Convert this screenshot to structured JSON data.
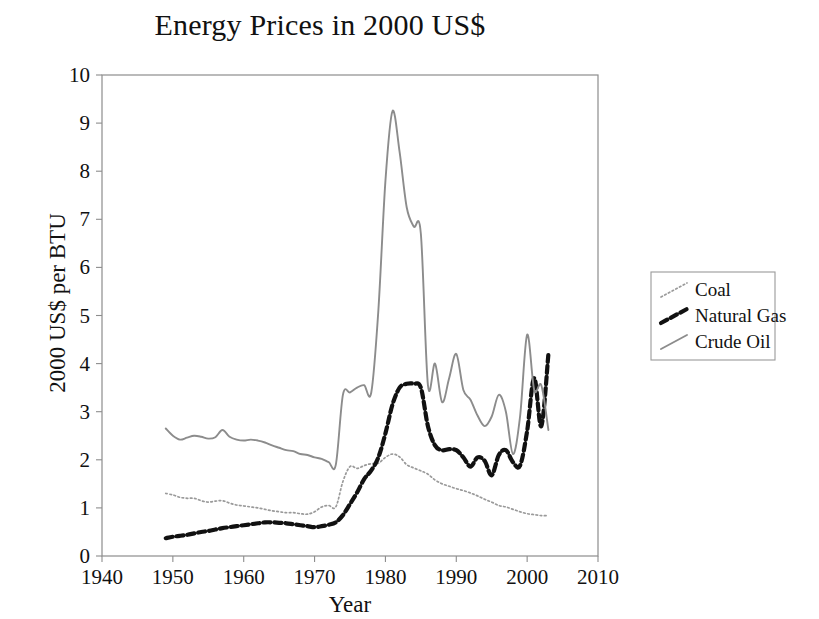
{
  "chart_data": {
    "type": "line",
    "title": "Energy Prices in 2000 US$",
    "xlabel": "Year",
    "ylabel": "2000 US$ per BTU",
    "xlim": [
      1940,
      2010
    ],
    "ylim": [
      0,
      10
    ],
    "xticks": [
      1940,
      1950,
      1960,
      1970,
      1980,
      1990,
      2000,
      2010
    ],
    "yticks": [
      0,
      1,
      2,
      3,
      4,
      5,
      6,
      7,
      8,
      9,
      10
    ],
    "grid": false,
    "legend_position": "right-outside",
    "x": [
      1949,
      1950,
      1951,
      1952,
      1953,
      1954,
      1955,
      1956,
      1957,
      1958,
      1959,
      1960,
      1961,
      1962,
      1963,
      1964,
      1965,
      1966,
      1967,
      1968,
      1969,
      1970,
      1971,
      1972,
      1973,
      1974,
      1975,
      1976,
      1977,
      1978,
      1979,
      1980,
      1981,
      1982,
      1983,
      1984,
      1985,
      1986,
      1987,
      1988,
      1989,
      1990,
      1991,
      1992,
      1993,
      1994,
      1995,
      1996,
      1997,
      1998,
      1999,
      2000,
      2001,
      2002,
      2003
    ],
    "series": [
      {
        "name": "Coal",
        "style": "dotted",
        "color": "#9a9a9a",
        "values": [
          1.3,
          1.27,
          1.22,
          1.2,
          1.2,
          1.15,
          1.12,
          1.14,
          1.15,
          1.1,
          1.06,
          1.04,
          1.02,
          1.0,
          0.97,
          0.94,
          0.92,
          0.9,
          0.9,
          0.88,
          0.87,
          0.92,
          1.02,
          1.05,
          1.02,
          1.55,
          1.86,
          1.82,
          1.88,
          1.92,
          1.93,
          2.05,
          2.12,
          2.06,
          1.9,
          1.83,
          1.77,
          1.7,
          1.58,
          1.5,
          1.45,
          1.4,
          1.36,
          1.31,
          1.25,
          1.18,
          1.12,
          1.05,
          1.02,
          0.97,
          0.92,
          0.88,
          0.86,
          0.84,
          0.84
        ]
      },
      {
        "name": "Natural Gas",
        "style": "dashed",
        "color": "#111111",
        "values": [
          0.37,
          0.4,
          0.42,
          0.44,
          0.47,
          0.5,
          0.52,
          0.55,
          0.58,
          0.6,
          0.62,
          0.64,
          0.66,
          0.68,
          0.7,
          0.7,
          0.69,
          0.68,
          0.66,
          0.64,
          0.62,
          0.6,
          0.62,
          0.65,
          0.7,
          0.85,
          1.08,
          1.32,
          1.6,
          1.78,
          2.05,
          2.55,
          3.15,
          3.5,
          3.58,
          3.58,
          3.5,
          2.7,
          2.3,
          2.2,
          2.22,
          2.2,
          2.05,
          1.86,
          2.05,
          1.98,
          1.68,
          2.1,
          2.2,
          1.95,
          1.88,
          2.6,
          3.7,
          2.7,
          4.2
        ]
      },
      {
        "name": "Crude Oil",
        "style": "solid",
        "color": "#8c8c8c",
        "values": [
          2.65,
          2.5,
          2.42,
          2.46,
          2.5,
          2.48,
          2.44,
          2.47,
          2.62,
          2.48,
          2.42,
          2.4,
          2.42,
          2.4,
          2.36,
          2.3,
          2.25,
          2.2,
          2.18,
          2.12,
          2.1,
          2.05,
          2.02,
          1.95,
          1.9,
          3.35,
          3.4,
          3.5,
          3.55,
          3.4,
          5.1,
          7.8,
          9.25,
          8.4,
          7.25,
          6.85,
          6.7,
          3.55,
          4.0,
          3.2,
          3.7,
          4.2,
          3.45,
          3.25,
          2.92,
          2.7,
          2.9,
          3.35,
          3.0,
          2.12,
          2.9,
          4.6,
          3.45,
          3.55,
          2.62
        ]
      }
    ]
  },
  "legend": {
    "items": [
      {
        "label": "Coal"
      },
      {
        "label": "Natural Gas"
      },
      {
        "label": "Crude Oil"
      }
    ]
  }
}
